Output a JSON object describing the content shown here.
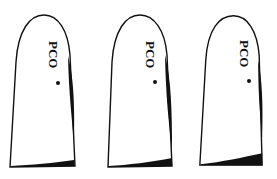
{
  "figure": {
    "panels": [
      {
        "label": "PCO",
        "id": 1
      },
      {
        "label": "PCO",
        "id": 2
      },
      {
        "label": "PCO",
        "id": 3
      }
    ]
  },
  "colors": {
    "outline": "#111111",
    "fill": "#ffffff",
    "opacity_region": "#111111"
  }
}
